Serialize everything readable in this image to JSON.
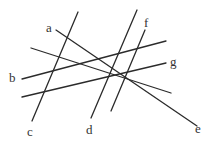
{
  "diagram": {
    "type": "intersecting-lines",
    "line_color": "#2b2b2b",
    "lines": [
      {
        "id": "a",
        "label": "a",
        "x1": 56,
        "y1": 30,
        "x2": 197,
        "y2": 126,
        "label_x": 46,
        "label_y": 32
      },
      {
        "id": "b",
        "label": "b",
        "x1": 22,
        "y1": 79,
        "x2": 166,
        "y2": 41,
        "label_x": 9,
        "label_y": 82
      },
      {
        "id": "c",
        "label": "c",
        "x1": 78,
        "y1": 12,
        "x2": 32,
        "y2": 121,
        "label_x": 27,
        "label_y": 136
      },
      {
        "id": "d",
        "label": "d",
        "x1": 137,
        "y1": 10,
        "x2": 91,
        "y2": 118,
        "label_x": 86,
        "label_y": 134
      },
      {
        "id": "e",
        "label": "e",
        "x1": 31,
        "y1": 48,
        "x2": 171,
        "y2": 93,
        "label_x": 195,
        "label_y": 133
      },
      {
        "id": "f",
        "label": "f",
        "x1": 145,
        "y1": 30,
        "x2": 111,
        "y2": 111,
        "label_x": 144,
        "label_y": 27
      },
      {
        "id": "g",
        "label": "g",
        "x1": 22,
        "y1": 97,
        "x2": 166,
        "y2": 63,
        "label_x": 170,
        "label_y": 66
      }
    ]
  }
}
